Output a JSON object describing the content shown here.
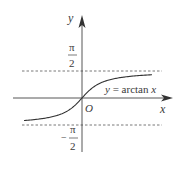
{
  "chart_data": {
    "type": "line",
    "title": "",
    "function_label": "y = arctan x",
    "xlabel": "x",
    "ylabel": "y",
    "origin_label": "O",
    "asymptotes": [
      {
        "name": "upper",
        "value_label_num": "π",
        "value_label_den": "2",
        "value": 1.5708,
        "style": "dashed"
      },
      {
        "name": "lower",
        "value_label_num": "π",
        "value_label_den": "2",
        "value_label_sign": "−",
        "value": -1.5708,
        "style": "dashed"
      }
    ],
    "series": [
      {
        "name": "y = arctan x",
        "x": [
          -4,
          -3,
          -2,
          -1.5,
          -1,
          -0.5,
          0,
          0.5,
          1,
          1.5,
          2,
          3,
          4
        ],
        "y": [
          -1.3258,
          -1.249,
          -1.1071,
          -0.9828,
          -0.7854,
          -0.4636,
          0,
          0.4636,
          0.7854,
          0.9828,
          1.1071,
          1.249,
          1.3258
        ]
      }
    ],
    "grid": false,
    "legend": "none"
  },
  "labels": {
    "y_axis": "y",
    "x_axis": "x",
    "origin": "O",
    "curve_y": "y",
    "curve_eq": " = arctan ",
    "curve_x": "x",
    "upper_num": "π",
    "upper_den": "2",
    "lower_sign": "−",
    "lower_num": "π",
    "lower_den": "2"
  }
}
